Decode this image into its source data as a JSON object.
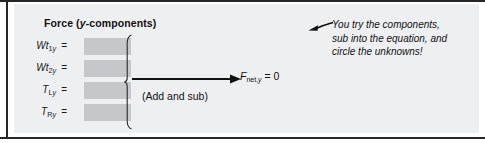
{
  "figure": {
    "panel_title_prefix": "Force (",
    "panel_title_italic": "y",
    "panel_title_suffix": "-components)",
    "background_color": "#eeeff1",
    "blank_box_color": "#c5c7ca",
    "rule_color": "#262626"
  },
  "rows": [
    {
      "symbol": "Wt",
      "sub_number": "1",
      "sub_axis": "y",
      "equals": "=",
      "value": ""
    },
    {
      "symbol": "Wt",
      "sub_number": "2",
      "sub_axis": "y",
      "equals": "=",
      "value": ""
    },
    {
      "symbol": "T",
      "sub_number": "L",
      "sub_axis": "y",
      "equals": "=",
      "value": ""
    },
    {
      "symbol": "T",
      "sub_number": "R",
      "sub_axis": "y",
      "equals": "=",
      "value": ""
    }
  ],
  "operation": {
    "label": "(Add and sub)",
    "brace_name": "curly-brace",
    "arrow_name": "rightward-arrow"
  },
  "result": {
    "symbol": "F",
    "subscript_prefix": "net,",
    "subscript_axis": "y",
    "equals_zero": " = 0"
  },
  "note": {
    "line1": "You try the components,",
    "line2": "sub into the equation, and",
    "line3": "circle the unknowns!",
    "arrow_name": "note-pointer-arrow"
  }
}
